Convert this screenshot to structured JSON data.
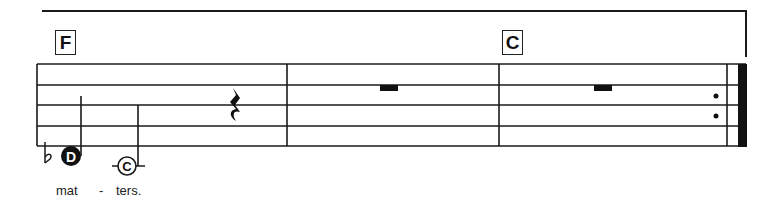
{
  "score": {
    "chord_symbols": [
      {
        "label": "F",
        "measure": 1
      },
      {
        "label": "C",
        "measure": 3
      }
    ],
    "notes": [
      {
        "name": "D",
        "accidental": "flat",
        "style": "filled",
        "duration": "half"
      },
      {
        "name": "C",
        "style": "open",
        "ledger_line": true,
        "duration": "half"
      }
    ],
    "rests": [
      {
        "type": "quarter-rest",
        "measure": 1
      },
      {
        "type": "whole-rest",
        "measure": 2
      },
      {
        "type": "whole-rest",
        "measure": 3
      }
    ],
    "ending": "final-repeat-barline",
    "lyrics": [
      {
        "text": "mat"
      },
      {
        "text": "-"
      },
      {
        "text": "ters."
      }
    ],
    "colors": {
      "ink": "#1a1a1a",
      "paper": "#ffffff"
    }
  }
}
